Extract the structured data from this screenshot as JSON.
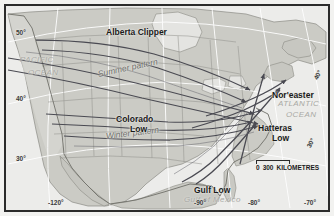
{
  "map": {
    "title": "North American Storm Tracks",
    "colors": {
      "land": "#cfcfc9",
      "land_light": "#dededa",
      "ocean": "#ededea",
      "coast": "#8e8e88",
      "border_line": "#7a7a74",
      "frame": "#2b2b2b",
      "track_arrow": "#4a4a52",
      "graticule": "#ffffff",
      "ocean_label": "#a9a9a5",
      "pattern_label": "#6e6e6a",
      "place_label": "#1a1a1a"
    },
    "features": [
      {
        "name": "Alberta Clipper",
        "style": "bold",
        "x": 108,
        "y": 30
      },
      {
        "name": "Nor'easter",
        "style": "bold",
        "x": 272,
        "y": 91
      },
      {
        "name": "Colorado",
        "style": "bold",
        "x": 118,
        "y": 115
      },
      {
        "name": "Low",
        "style": "bold",
        "x": 131,
        "y": 125
      },
      {
        "name": "Hatteras",
        "style": "bold",
        "x": 260,
        "y": 124
      },
      {
        "name": "Low",
        "style": "bold",
        "x": 272,
        "y": 134
      },
      {
        "name": "Gulf Low",
        "style": "bold",
        "x": 196,
        "y": 186
      }
    ],
    "patterns": [
      {
        "name": "Summer pattern",
        "x": 98,
        "y": 70,
        "rotate": -12
      },
      {
        "name": "Winter pattern",
        "x": 104,
        "y": 131,
        "rotate": -7
      }
    ],
    "oceans": [
      {
        "name": "PACIFIC",
        "x": 14,
        "y": 57
      },
      {
        "name": "OCEAN",
        "x": 22,
        "y": 70
      },
      {
        "name": "ATLANTIC",
        "x": 277,
        "y": 101
      },
      {
        "name": "OCEAN",
        "x": 285,
        "y": 112
      },
      {
        "name": "Gulf of Mexico",
        "x": 184,
        "y": 196
      }
    ],
    "graticule": {
      "latitudes": [
        {
          "label": "50°",
          "x": 14,
          "y": 28,
          "rotate": false
        },
        {
          "label": "40°",
          "x": 14,
          "y": 94,
          "rotate": false
        },
        {
          "label": "30°",
          "x": 14,
          "y": 155,
          "rotate": false
        },
        {
          "label": "40°",
          "x": 312,
          "y": 76,
          "rotate": true
        },
        {
          "label": "30°",
          "x": 307,
          "y": 142,
          "rotate": true
        }
      ],
      "longitudes": [
        {
          "label": "-120°",
          "x": 49,
          "y": 200
        },
        {
          "label": "-90°",
          "x": 195,
          "y": 200
        },
        {
          "label": "-80°",
          "x": 248,
          "y": 200
        },
        {
          "label": "-70°",
          "x": 305,
          "y": 200
        }
      ]
    },
    "scale": {
      "zero_label": "0",
      "distance_label": "300",
      "unit_label": "KILOMETRES",
      "x": 252,
      "y": 160
    }
  }
}
